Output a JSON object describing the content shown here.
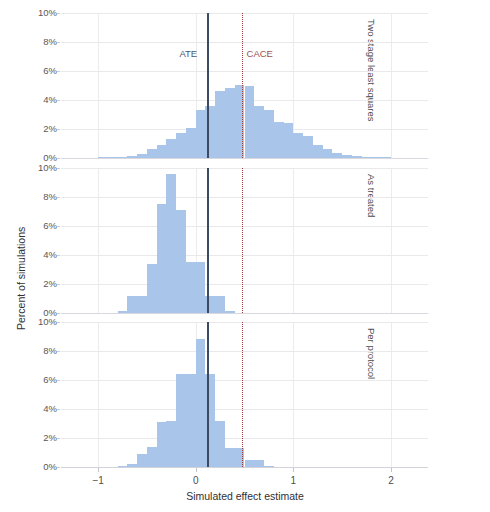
{
  "chart_data": {
    "type": "bar",
    "subtype": "histogram",
    "title": "",
    "xlabel": "Simulated effect estimate",
    "ylabel": "Percent of simulations",
    "xlim": [
      -1.38,
      2.38
    ],
    "ylim": [
      0,
      10
    ],
    "xticks": [
      -1,
      0,
      1,
      2
    ],
    "xtick_labels": [
      "−1",
      "0",
      "1",
      "2"
    ],
    "yticks": [
      0,
      2,
      4,
      6,
      8,
      10
    ],
    "ytick_labels": [
      "0%",
      "2%",
      "4%",
      "6%",
      "8%",
      "10%"
    ],
    "grid": "horizontal and vertical, light gray",
    "legend": "none",
    "bar_color": "#a9c6ea",
    "annotations": [
      {
        "name": "ATE",
        "label": "ATE",
        "x": 0.12,
        "style": "solid",
        "color": "#3c4a63"
      },
      {
        "name": "CACE",
        "label": "CACE",
        "x": 0.47,
        "style": "dotted",
        "color": "#9c3b3b"
      }
    ],
    "panels": [
      {
        "name": "two-stage-least-squares",
        "label": "Two stage least squares",
        "bin_width": 0.1,
        "bins": [
          {
            "x": -0.95,
            "value": 0.05
          },
          {
            "x": -0.85,
            "value": 0.08
          },
          {
            "x": -0.75,
            "value": 0.1
          },
          {
            "x": -0.65,
            "value": 0.15
          },
          {
            "x": -0.55,
            "value": 0.3
          },
          {
            "x": -0.45,
            "value": 0.6
          },
          {
            "x": -0.35,
            "value": 0.9
          },
          {
            "x": -0.25,
            "value": 1.3
          },
          {
            "x": -0.15,
            "value": 1.7
          },
          {
            "x": -0.05,
            "value": 2.1
          },
          {
            "x": 0.05,
            "value": 3.3
          },
          {
            "x": 0.15,
            "value": 3.6
          },
          {
            "x": 0.25,
            "value": 4.6
          },
          {
            "x": 0.35,
            "value": 4.8
          },
          {
            "x": 0.45,
            "value": 5.05
          },
          {
            "x": 0.55,
            "value": 5.0
          },
          {
            "x": 0.65,
            "value": 3.6
          },
          {
            "x": 0.75,
            "value": 3.3
          },
          {
            "x": 0.85,
            "value": 2.5
          },
          {
            "x": 0.95,
            "value": 2.4
          },
          {
            "x": 1.05,
            "value": 1.7
          },
          {
            "x": 1.15,
            "value": 1.5
          },
          {
            "x": 1.25,
            "value": 0.9
          },
          {
            "x": 1.35,
            "value": 0.6
          },
          {
            "x": 1.45,
            "value": 0.35
          },
          {
            "x": 1.55,
            "value": 0.2
          },
          {
            "x": 1.65,
            "value": 0.12
          },
          {
            "x": 1.75,
            "value": 0.08
          },
          {
            "x": 1.85,
            "value": 0.06
          },
          {
            "x": 1.95,
            "value": 0.04
          }
        ]
      },
      {
        "name": "as-treated",
        "label": "As treated",
        "bin_width": 0.1,
        "bins": [
          {
            "x": -0.75,
            "value": 0.12
          },
          {
            "x": -0.65,
            "value": 1.2
          },
          {
            "x": -0.55,
            "value": 1.2
          },
          {
            "x": -0.45,
            "value": 3.4
          },
          {
            "x": -0.35,
            "value": 7.5
          },
          {
            "x": -0.25,
            "value": 9.6
          },
          {
            "x": -0.15,
            "value": 7.1
          },
          {
            "x": -0.05,
            "value": 3.55
          },
          {
            "x": 0.05,
            "value": 3.55
          },
          {
            "x": 0.15,
            "value": 1.15
          },
          {
            "x": 0.25,
            "value": 1.15
          },
          {
            "x": 0.35,
            "value": 0.12
          }
        ]
      },
      {
        "name": "per-protocol",
        "label": "Per protocol",
        "bin_width": 0.1,
        "bins": [
          {
            "x": -0.75,
            "value": 0.1
          },
          {
            "x": -0.65,
            "value": 0.22
          },
          {
            "x": -0.55,
            "value": 0.9
          },
          {
            "x": -0.45,
            "value": 1.4
          },
          {
            "x": -0.35,
            "value": 3.1
          },
          {
            "x": -0.25,
            "value": 3.2
          },
          {
            "x": -0.15,
            "value": 6.4
          },
          {
            "x": -0.05,
            "value": 6.4
          },
          {
            "x": 0.05,
            "value": 8.8
          },
          {
            "x": 0.15,
            "value": 6.4
          },
          {
            "x": 0.25,
            "value": 3.2
          },
          {
            "x": 0.35,
            "value": 1.3
          },
          {
            "x": 0.45,
            "value": 1.3
          },
          {
            "x": 0.55,
            "value": 0.45
          },
          {
            "x": 0.65,
            "value": 0.45
          },
          {
            "x": 0.75,
            "value": 0.1
          }
        ]
      }
    ]
  }
}
